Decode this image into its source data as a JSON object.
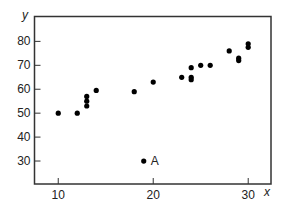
{
  "chart_data": {
    "type": "scatter",
    "title": "",
    "xlabel": "x",
    "ylabel": "y",
    "xlim": [
      7.5,
      32.4
    ],
    "ylim": [
      20.4,
      90.4
    ],
    "x_ticks": [
      10,
      20,
      30
    ],
    "y_ticks": [
      30,
      40,
      50,
      60,
      70,
      80
    ],
    "grid": false,
    "legend": null,
    "points": [
      {
        "x": 10,
        "y": 50
      },
      {
        "x": 12,
        "y": 50
      },
      {
        "x": 13,
        "y": 53
      },
      {
        "x": 13,
        "y": 55
      },
      {
        "x": 13,
        "y": 57
      },
      {
        "x": 14,
        "y": 59.5
      },
      {
        "x": 18,
        "y": 59
      },
      {
        "x": 20,
        "y": 63
      },
      {
        "x": 23,
        "y": 65
      },
      {
        "x": 24,
        "y": 64
      },
      {
        "x": 24,
        "y": 65
      },
      {
        "x": 24,
        "y": 69
      },
      {
        "x": 25,
        "y": 70
      },
      {
        "x": 26,
        "y": 70
      },
      {
        "x": 28,
        "y": 76
      },
      {
        "x": 29,
        "y": 72
      },
      {
        "x": 29,
        "y": 73
      },
      {
        "x": 30,
        "y": 77.5
      },
      {
        "x": 30,
        "y": 79
      },
      {
        "x": 19,
        "y": 30,
        "label": "A"
      }
    ],
    "annotations": [
      {
        "text": "A",
        "x": 19,
        "y": 30
      }
    ]
  },
  "colors": {
    "axis": "#333333",
    "points": "#000000",
    "text": "#222222"
  }
}
